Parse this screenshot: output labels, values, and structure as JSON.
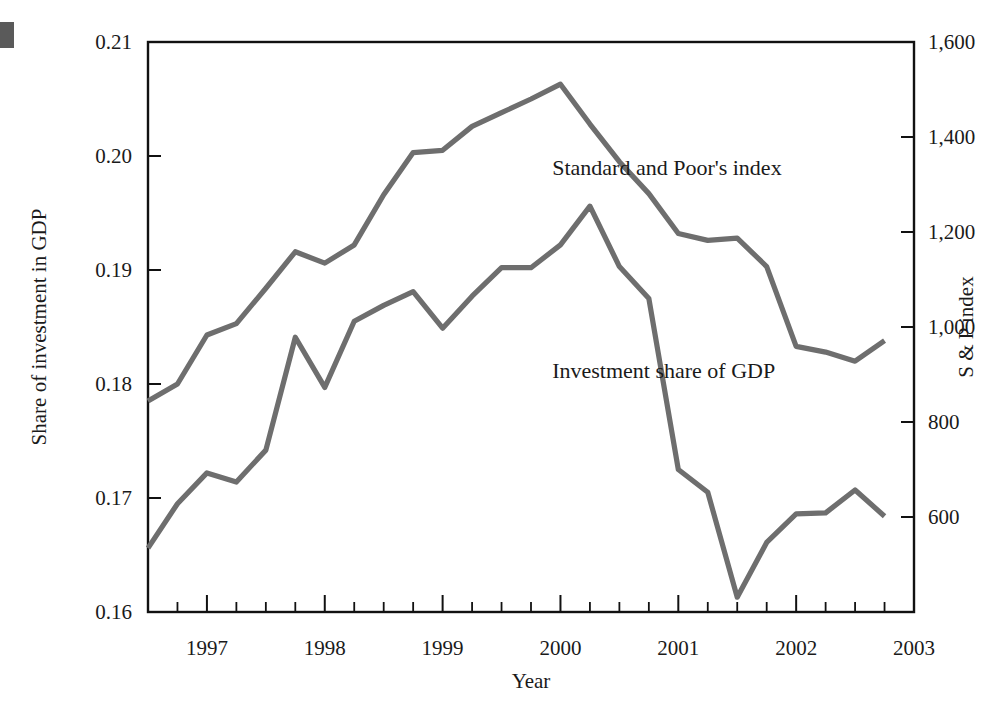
{
  "figure": {
    "corner_marker_color": "#5a5a5a",
    "line_color": "#6e6e6e",
    "axis_color": "#111111"
  },
  "chart_data": {
    "type": "line",
    "title": "",
    "xlabel": "Year",
    "ylabel": "Share of investment in GDP",
    "ylabel_right": "S & P index",
    "grid": false,
    "legend": "inline-annotations",
    "xlim": [
      1996.5,
      2003.0
    ],
    "ylim_left": [
      0.16,
      0.21
    ],
    "ylim_right": [
      400,
      1600
    ],
    "xticks": [
      1997,
      1998,
      1999,
      2000,
      2001,
      2002,
      2003
    ],
    "xtick_labels": [
      "1997",
      "1998",
      "1999",
      "2000",
      "2001",
      "2002",
      "2003"
    ],
    "xminor_step": 0.25,
    "yticks_left": [
      0.16,
      0.17,
      0.18,
      0.19,
      0.2,
      0.21
    ],
    "ytick_labels_left": [
      "0.16",
      "0.17",
      "0.18",
      "0.19",
      "0.20",
      "0.21"
    ],
    "yticks_right": [
      600,
      800,
      1000,
      1200,
      1400,
      1600
    ],
    "ytick_labels_right": [
      "600",
      "800",
      "1,000",
      "1,200",
      "1,400",
      "1,600"
    ],
    "series": [
      {
        "name": "Standard and Poor's index",
        "axis": "right",
        "annotation": "Standard and Poor's index",
        "annotation_x": 1999.93,
        "annotation_y_left": 0.1983,
        "x": [
          1996.5,
          1996.75,
          1997.0,
          1997.25,
          1997.5,
          1997.75,
          1998.0,
          1998.25,
          1998.5,
          1998.75,
          1999.0,
          1999.25,
          1999.5,
          1999.75,
          2000.0,
          2000.25,
          2000.5,
          2000.75,
          2001.0,
          2001.25,
          2001.5,
          2001.75,
          2002.0,
          2002.25,
          2002.5,
          2002.75
        ],
        "y_left_units": [
          0.1785,
          0.18,
          0.1843,
          0.1853,
          0.1884,
          0.1916,
          0.1906,
          0.1922,
          0.1966,
          0.2003,
          0.2005,
          0.2026,
          0.2038,
          0.205,
          0.2063,
          0.2028,
          0.1995,
          0.1967,
          0.1932,
          0.1926,
          0.1928,
          0.1903,
          0.1833,
          0.1828,
          0.182,
          0.1838
        ],
        "y_right_units": [
          790,
          826,
          929,
          953,
          1027,
          1104,
          1080,
          1118,
          1224,
          1312,
          1316,
          1367,
          1396,
          1425,
          1456,
          1372,
          1293,
          1226,
          1142,
          1127,
          1132,
          1072,
          905,
          893,
          874,
          917
        ]
      },
      {
        "name": "Investment share of GDP",
        "axis": "left",
        "annotation": "Investment share of GDP",
        "annotation_x": 1999.93,
        "annotation_y_left": 0.1805,
        "x": [
          1996.5,
          1996.75,
          1997.0,
          1997.25,
          1997.5,
          1997.75,
          1998.0,
          1998.25,
          1998.5,
          1998.75,
          1999.0,
          1999.25,
          1999.5,
          1999.75,
          2000.0,
          2000.25,
          2000.5,
          2000.75,
          2001.0,
          2001.25,
          2001.5,
          2001.75,
          2002.0,
          2002.25,
          2002.5,
          2002.75
        ],
        "y_left_units": [
          0.1656,
          0.1695,
          0.1722,
          0.1714,
          0.1742,
          0.1841,
          0.1797,
          0.1855,
          0.1869,
          0.1881,
          0.1849,
          0.1877,
          0.1902,
          0.1902,
          0.1922,
          0.1956,
          0.1903,
          0.1875,
          0.1725,
          0.1705,
          0.1613,
          0.1661,
          0.1686,
          0.1687,
          0.1707,
          0.1684
        ]
      }
    ]
  }
}
